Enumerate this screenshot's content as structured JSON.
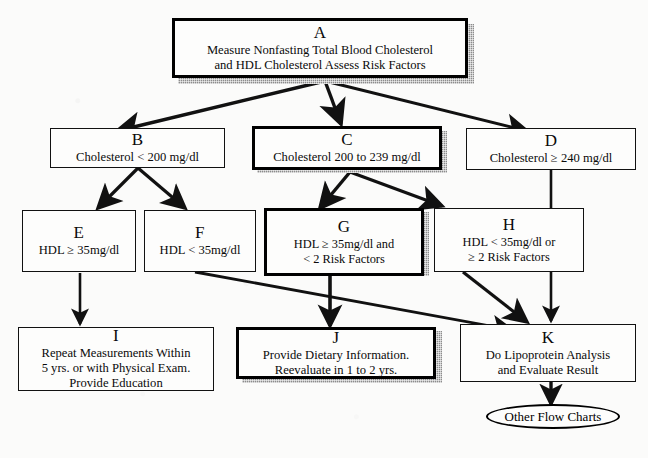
{
  "chart": {
    "type": "flowchart",
    "background_color": "#fbfbfa",
    "line_color": "#111111",
    "shadow_color": "#8c8c8c"
  },
  "nodes": {
    "a": {
      "tag": "A",
      "body": "Measure Nonfasting Total Blood Cholesterol\nand HDL Cholesterol Assess Risk Factors",
      "emphasis": "heavy"
    },
    "b": {
      "tag": "B",
      "body": "Cholesterol < 200 mg/dl",
      "emphasis": "normal"
    },
    "c": {
      "tag": "C",
      "body": "Cholesterol  200 to 239 mg/dl",
      "emphasis": "heavy"
    },
    "d": {
      "tag": "D",
      "body": "Cholesterol ≥ 240 mg/dl",
      "emphasis": "normal"
    },
    "e": {
      "tag": "E",
      "body": "HDL ≥ 35mg/dl",
      "emphasis": "normal"
    },
    "f": {
      "tag": "F",
      "body": "HDL < 35mg/dl",
      "emphasis": "normal"
    },
    "g": {
      "tag": "G",
      "body": "HDL ≥ 35mg/dl and\n< 2 Risk Factors",
      "emphasis": "heavy"
    },
    "h": {
      "tag": "H",
      "body": "HDL < 35mg/dl or\n≥ 2 Risk Factors",
      "emphasis": "normal"
    },
    "i": {
      "tag": "I",
      "body": "Repeat Measurements Within\n5 yrs. or with Physical Exam.\nProvide Education",
      "emphasis": "normal"
    },
    "j": {
      "tag": "J",
      "body": "Provide Dietary Information.\nReevaluate in 1 to 2 yrs.",
      "emphasis": "heavy"
    },
    "k": {
      "tag": "K",
      "body": "Do Lipoprotein Analysis\nand Evaluate Result",
      "emphasis": "normal"
    },
    "terminator": {
      "label": "Other Flow Charts"
    }
  },
  "edges": [
    {
      "from": "A",
      "to": "B",
      "style": "arrow"
    },
    {
      "from": "A",
      "to": "C",
      "style": "arrow"
    },
    {
      "from": "A",
      "to": "D",
      "style": "arrow"
    },
    {
      "from": "B",
      "to": "E",
      "style": "arrow"
    },
    {
      "from": "B",
      "to": "F",
      "style": "arrow"
    },
    {
      "from": "C",
      "to": "G",
      "style": "arrow"
    },
    {
      "from": "C",
      "to": "H",
      "style": "arrow"
    },
    {
      "from": "D",
      "to": "K",
      "style": "arrow"
    },
    {
      "from": "E",
      "to": "I",
      "style": "arrow"
    },
    {
      "from": "F",
      "to": "K",
      "style": "arrow"
    },
    {
      "from": "G",
      "to": "J",
      "style": "arrow"
    },
    {
      "from": "H",
      "to": "K",
      "style": "arrow"
    },
    {
      "from": "K",
      "to": "Other Flow Charts",
      "style": "arrow"
    }
  ]
}
